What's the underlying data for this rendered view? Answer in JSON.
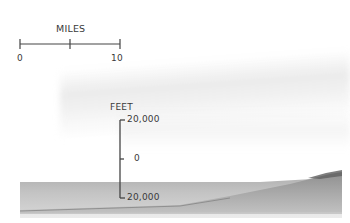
{
  "horizontal_scale": {
    "title": "MILES",
    "tick_labels": [
      "0",
      "10"
    ]
  },
  "vertical_scale": {
    "title": "FEET",
    "tick_labels": [
      "20,000",
      "0",
      "20,000"
    ]
  },
  "colors": {
    "background": "#ffffff",
    "ink": "#3a3a3a",
    "seafloor": "#9a9a9a",
    "seafloor_dark": "#6f6f6f",
    "haze": "#e4e4e4"
  }
}
